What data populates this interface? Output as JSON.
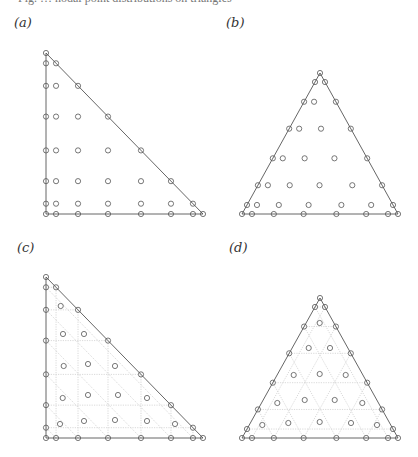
{
  "figure": {
    "top_clipped_text": "Fig. … nodal point distributions on triangles",
    "panels": [
      {
        "id": "a",
        "label": "(a)",
        "shape": "right-triangle",
        "grid": false,
        "vertices": [
          [
            46,
            53
          ],
          [
            46,
            214
          ],
          [
            203,
            214
          ]
        ],
        "label_pos": [
          14,
          22
        ]
      },
      {
        "id": "b",
        "label": "(b)",
        "shape": "equilateral-triangle",
        "grid": false,
        "vertices": [
          [
            320,
            73
          ],
          [
            242,
            214
          ],
          [
            398,
            214
          ]
        ],
        "label_pos": [
          226,
          22
        ]
      },
      {
        "id": "c",
        "label": "(c)",
        "shape": "right-triangle",
        "grid": true,
        "vertices": [
          [
            46,
            277
          ],
          [
            46,
            438
          ],
          [
            203,
            438
          ]
        ],
        "label_pos": [
          17,
          246
        ]
      },
      {
        "id": "d",
        "label": "(d)",
        "shape": "equilateral-triangle",
        "grid": true,
        "vertices": [
          [
            320,
            298
          ],
          [
            242,
            438
          ],
          [
            398,
            438
          ]
        ],
        "label_pos": [
          229,
          246
        ]
      }
    ],
    "edge_parameters": [
      0,
      0.064,
      0.204,
      0.395,
      0.605,
      0.796,
      0.936,
      1
    ],
    "interior_points_c": [
      [
        60.7,
        306
      ],
      [
        63,
        334
      ],
      [
        84,
        334
      ],
      [
        63.7,
        366
      ],
      [
        88,
        364
      ],
      [
        115,
        366
      ],
      [
        62.7,
        398
      ],
      [
        88,
        395
      ],
      [
        118,
        395
      ],
      [
        147,
        398
      ],
      [
        60,
        424
      ],
      [
        84,
        421
      ],
      [
        115,
        420
      ],
      [
        147,
        421
      ],
      [
        175,
        424
      ]
    ],
    "interior_points_d": [
      [
        319.7,
        323
      ],
      [
        308.7,
        348
      ],
      [
        330,
        348
      ],
      [
        293.7,
        375
      ],
      [
        319.7,
        374
      ],
      [
        345.7,
        375
      ],
      [
        277.3,
        403
      ],
      [
        304.7,
        400
      ],
      [
        334.7,
        400
      ],
      [
        362.3,
        403
      ],
      [
        262.3,
        425
      ],
      [
        288.3,
        423
      ],
      [
        319.7,
        422
      ],
      [
        351,
        423
      ],
      [
        377,
        425
      ]
    ],
    "colors": {
      "edge": "#555555",
      "marker": "#555555",
      "grid": "#cfcfcf"
    }
  }
}
